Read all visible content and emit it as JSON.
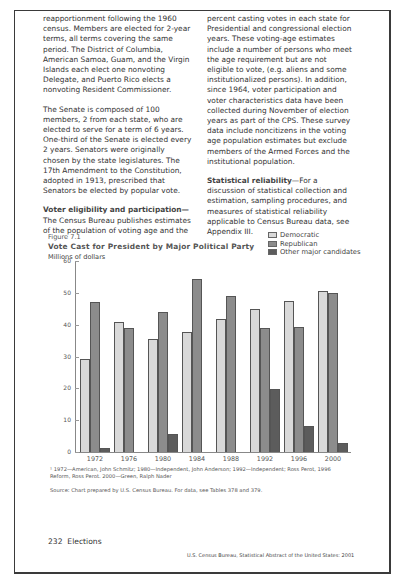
{
  "left_column": {
    "paragraphs": [
      "reapportionment following the 1960 census. Members are elected for 2-year terms, all terms covering the same period. The District of Columbia, American Samoa, Guam, and the Virgin Islands each elect one nonvoting Delegate, and Puerto Rico elects a nonvoting Resident Commissioner.",
      "The Senate is composed of 100 members, 2 from each state, who are elected to serve for a term of 6 years. One-third of the Senate is elected every 2 years. Senators were originally chosen by the state legislatures. The 17th Amendment to the Constitution, adopted in 1913, prescribed that Senators be elected by popular vote."
    ],
    "voter_heading": "Voter eligibility and participation—",
    "voter_text": "The Census Bureau publishes estimates of the population of voting age and the"
  },
  "right_column": {
    "paragraphs": [
      "percent casting votes in each state for Presidential and congressional election years. These voting-age estimates include a number of persons who meet the age requirement but are not eligible to vote, (e.g. aliens and some institutionalized persons). In addition, since 1964, voter participation and voter characteristics data have been collected during November of election years as part of the CPS. These survey data include noncitizens in the voting age population estimates but exclude members of the Armed Forces and the institutional population."
    ],
    "reliability_heading": "Statistical reliability",
    "reliability_text": "—For a discussion of statistical collection and estimation, sampling procedures, and measures of statistical reliability applicable to Census Bureau data, see Appendix III."
  },
  "figure": {
    "label": "Figure 7.1",
    "title": "Vote Cast for President by Major Political Party",
    "units": "Millions of dollars",
    "footnote": "¹ 1972—American, John Schmitz; 1980—Independent, John Anderson; 1992—Independent; Ross Perot, 1996 Reform, Ross Perot. 2000—Green, Ralph Nader",
    "source": "Source: Chart prepared by U.S. Census Bureau. For data, see Tables 378 and 379."
  },
  "chart_data": {
    "type": "bar",
    "title": "Vote Cast for President by Major Political Party",
    "subtitle": "Figure 7.1",
    "ylabel": "Millions of dollars",
    "xlabel": "",
    "ylim": [
      0,
      60
    ],
    "yticks": [
      0,
      10,
      20,
      30,
      40,
      50,
      60
    ],
    "grid": false,
    "legend_position": "top-right",
    "categories": [
      "1972",
      "1976",
      "1980",
      "1984",
      "1988",
      "1992",
      "1996",
      "2000"
    ],
    "series": [
      {
        "name": "Democratic",
        "color": "#d9d9d9",
        "values": [
          29.2,
          40.8,
          35.5,
          37.6,
          41.8,
          44.9,
          47.4,
          50.6
        ]
      },
      {
        "name": "Republican",
        "color": "#8c8c8c",
        "values": [
          47.2,
          39.1,
          43.9,
          54.5,
          48.9,
          39.0,
          39.2,
          50.0
        ]
      },
      {
        "name": "Other major candidates",
        "color": "#5c5c5c",
        "values": [
          1.1,
          null,
          5.7,
          null,
          null,
          19.7,
          8.1,
          2.9
        ]
      }
    ]
  },
  "footer": {
    "page_number": "232",
    "section": "Elections",
    "running_foot": "U.S. Census Bureau, Statistical Abstract of the United States: 2001"
  }
}
